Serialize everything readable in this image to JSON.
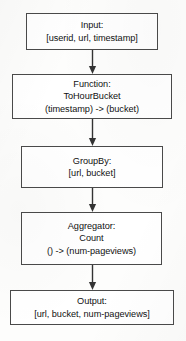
{
  "diagram": {
    "orientation": "vertical-top-to-bottom",
    "background_color": "#fdfdfc",
    "box_border_color": "#4a4a4a",
    "box_fill_color": "#ffffff",
    "text_color": "#111111",
    "arrow_color": "#333333",
    "nodes": [
      {
        "id": "input",
        "kind": "input",
        "lines": [
          "Input:",
          "[userid, url, timestamp]"
        ],
        "line1": "Input:",
        "line2": "[userid, url, timestamp]",
        "line3": ""
      },
      {
        "id": "function",
        "kind": "function",
        "lines": [
          "Function:",
          "ToHourBucket",
          "(timestamp) -> (bucket)"
        ],
        "line1": "Function:",
        "line2": "ToHourBucket",
        "line3": "(timestamp) -> (bucket)"
      },
      {
        "id": "groupby",
        "kind": "groupby",
        "lines": [
          "GroupBy:",
          "[url, bucket]"
        ],
        "line1": "GroupBy:",
        "line2": "[url, bucket]",
        "line3": ""
      },
      {
        "id": "aggregator",
        "kind": "aggregator",
        "lines": [
          "Aggregator:",
          "Count",
          "() -> (num-pageviews)"
        ],
        "line1": "Aggregator:",
        "line2": "Count",
        "line3": "() -> (num-pageviews)"
      },
      {
        "id": "output",
        "kind": "output",
        "lines": [
          "Output:",
          "[url, bucket, num-pageviews]"
        ],
        "line1": "Output:",
        "line2": "[url, bucket, num-pageviews]",
        "line3": ""
      }
    ],
    "edges": [
      {
        "id": "edge-input-function",
        "from": "input",
        "to": "function",
        "arrowhead": "filled-triangle"
      },
      {
        "id": "edge-function-groupby",
        "from": "function",
        "to": "groupby",
        "arrowhead": "filled-triangle"
      },
      {
        "id": "edge-groupby-aggregator",
        "from": "groupby",
        "to": "aggregator",
        "arrowhead": "filled-triangle"
      },
      {
        "id": "edge-aggregator-output",
        "from": "aggregator",
        "to": "output",
        "arrowhead": "filled-triangle"
      }
    ]
  }
}
